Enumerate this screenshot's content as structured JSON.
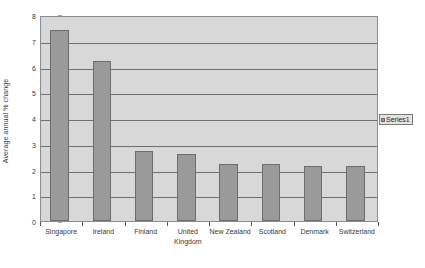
{
  "chart_data": {
    "type": "bar",
    "title": "",
    "subtitle": "",
    "xlabel": "",
    "ylabel": "Average annual % change",
    "categories": [
      "Singapore",
      "Ireland",
      "Finland",
      "United\nKingdom",
      "New Zealand",
      "Scotland",
      "Denmark",
      "Switzerland"
    ],
    "values": [
      7.4,
      6.2,
      2.7,
      2.6,
      2.2,
      2.2,
      2.15,
      2.15
    ],
    "series": [
      {
        "name": "Series1",
        "values": [
          7.4,
          6.2,
          2.7,
          2.6,
          2.2,
          2.2,
          2.15,
          2.15
        ]
      }
    ],
    "ylim": [
      0,
      8
    ],
    "yticks": [
      0,
      1,
      2,
      3,
      4,
      5,
      6,
      7,
      8
    ],
    "ytick_labels": [
      "0",
      "1",
      "2",
      "3",
      "4",
      "5",
      "6",
      "7",
      "8"
    ],
    "grid": true,
    "grid_axis": "y",
    "legend": [
      "Series1"
    ],
    "legend_position": "right",
    "colors": {
      "bar_fill": "#9a9a9a",
      "bar_edge": "#6d6d6d",
      "plot_background": "#d8d8d8",
      "gridline": "#6f6f6f",
      "axis": "#555555",
      "text": "#3a3a3a",
      "legend_background": "#e4e4e4"
    }
  },
  "legend": {
    "series1_label": "Series1"
  }
}
